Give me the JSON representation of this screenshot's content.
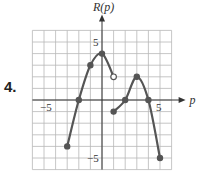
{
  "problem_number": "4.",
  "chart_data": {
    "type": "line",
    "title": "",
    "xlabel": "p",
    "ylabel": "R(p)",
    "xlim": [
      -6,
      6
    ],
    "ylim": [
      -6,
      6
    ],
    "grid": true,
    "x_tick_labels": [
      {
        "value": -5,
        "label": "−5"
      },
      {
        "value": 5,
        "label": "5"
      }
    ],
    "y_tick_labels": [
      {
        "value": 5,
        "label": "5"
      },
      {
        "value": -5,
        "label": "−5"
      }
    ],
    "series": [
      {
        "name": "piece-1",
        "points": [
          [
            -3,
            -4
          ],
          [
            -2,
            0
          ],
          [
            -1,
            3
          ],
          [
            0,
            4
          ],
          [
            1,
            2
          ]
        ],
        "start": "closed",
        "end": "open"
      },
      {
        "name": "piece-2",
        "points": [
          [
            1,
            -1
          ],
          [
            2,
            0
          ],
          [
            3,
            2
          ],
          [
            4,
            0
          ],
          [
            5,
            -5
          ]
        ],
        "start": "closed",
        "end": "closed"
      }
    ],
    "marked_points": [
      {
        "x": -3,
        "y": -4,
        "style": "closed"
      },
      {
        "x": -2,
        "y": 0,
        "style": "closed"
      },
      {
        "x": -1,
        "y": 3,
        "style": "closed"
      },
      {
        "x": 0,
        "y": 4,
        "style": "closed"
      },
      {
        "x": 1,
        "y": 2,
        "style": "open"
      },
      {
        "x": 1,
        "y": -1,
        "style": "closed"
      },
      {
        "x": 2,
        "y": 0,
        "style": "closed"
      },
      {
        "x": 3,
        "y": 2,
        "style": "closed"
      },
      {
        "x": 4,
        "y": 0,
        "style": "closed"
      },
      {
        "x": 5,
        "y": -5,
        "style": "closed"
      }
    ]
  }
}
